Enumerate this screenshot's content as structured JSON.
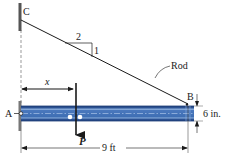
{
  "figure": {
    "type": "statics-beam-rod",
    "labels": {
      "point_c": "C",
      "point_a": "A",
      "point_b": "B",
      "rod": "Rod",
      "slope_run": "2",
      "slope_rise": "1",
      "load": "P",
      "load_position": "x",
      "beam_length": "9 ft",
      "beam_depth": "6 in."
    },
    "colors": {
      "beam_fill": "#3f6fb4",
      "beam_dark": "#1f3f7a",
      "beam_light": "#8fb0dc",
      "line": "#1a1a1a",
      "wall": "#555555"
    }
  }
}
